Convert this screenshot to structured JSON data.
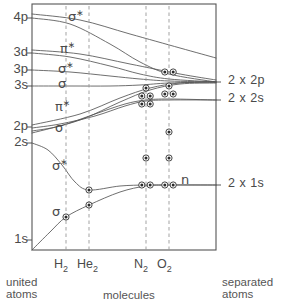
{
  "figure": {
    "type": "correlation-diagram",
    "title_visible": false,
    "frame": {
      "left": 32,
      "right": 216,
      "top": 4,
      "bottom": 250
    },
    "stroke_color": "#555555",
    "dash_color": "#999999",
    "text_color": "#4a4a4a"
  },
  "axis_left": {
    "name": "united-atom-orbital-levels",
    "ticks": [
      {
        "label": "4p",
        "y": 18
      },
      {
        "label": "3d",
        "y": 53
      },
      {
        "label": "3p",
        "y": 70
      },
      {
        "label": "3s",
        "y": 86
      },
      {
        "label": "2p",
        "y": 127
      },
      {
        "label": "2s",
        "y": 143
      },
      {
        "label": "1s",
        "y": 240
      }
    ]
  },
  "axis_right": {
    "name": "separated-atom-orbital-levels",
    "ticks": [
      {
        "label": "2 x 2p",
        "y": 82
      },
      {
        "label": "2 x 2s",
        "y": 100
      },
      {
        "label": "2 x 1s",
        "y": 185
      }
    ]
  },
  "orbital_labels": [
    {
      "text": "σ",
      "star": true,
      "x": 68,
      "y": 9,
      "name": "sigma-star-4p"
    },
    {
      "text": "π",
      "star": true,
      "x": 60,
      "y": 41,
      "name": "pi-star-3d"
    },
    {
      "text": "σ",
      "star": true,
      "x": 58,
      "y": 61,
      "name": "sigma-star-3p"
    },
    {
      "text": "σ",
      "star": false,
      "x": 58,
      "y": 77,
      "name": "sigma-3s"
    },
    {
      "text": "π",
      "star": true,
      "x": 55,
      "y": 99,
      "name": "pi-star-2p"
    },
    {
      "text": "σ",
      "star": false,
      "x": 55,
      "y": 121,
      "name": "sigma-2p"
    },
    {
      "text": "σ",
      "star": true,
      "x": 52,
      "y": 158,
      "name": "sigma-star-2s"
    },
    {
      "text": "σ",
      "star": false,
      "x": 52,
      "y": 205,
      "name": "sigma-1s"
    },
    {
      "text": "n",
      "star": false,
      "x": 181,
      "y": 173,
      "name": "nonbonding-n"
    }
  ],
  "molecules": [
    {
      "label": "H",
      "sub": "2",
      "x": 66,
      "name": "molecule-h2"
    },
    {
      "label": "He",
      "sub": "2",
      "x": 89,
      "name": "molecule-he2"
    },
    {
      "label": "N",
      "sub": "2",
      "x": 146,
      "name": "molecule-n2"
    },
    {
      "label": "O",
      "sub": "2",
      "x": 169,
      "name": "molecule-o2"
    }
  ],
  "footer": {
    "united_line1": "united",
    "united_line2": "atoms",
    "middle": "molecules",
    "separated_line1": "separated",
    "separated_line2": "atoms"
  },
  "chart_data": {
    "type": "line",
    "xlabel": "molecules",
    "ylabel": "orbital energy",
    "grid": false,
    "legend_position": "none",
    "x_category_positions": {
      "united_atom": 32,
      "H2": 66,
      "He2": 89,
      "N2": 146,
      "O2": 169,
      "separated_atoms": 216
    },
    "united_atom_levels": [
      "1s",
      "2s",
      "2p",
      "3s",
      "3p",
      "3d",
      "4p"
    ],
    "separated_atom_levels": [
      "2 x 1s",
      "2 x 2s",
      "2 x 2p"
    ],
    "correlation_curves": [
      {
        "name": "sigma-1s-bonding",
        "label": "σ",
        "from": "1s",
        "to": "2 x 1s",
        "path": [
          [
            32,
            250
          ],
          [
            50,
            232
          ],
          [
            66,
            217
          ],
          [
            89,
            205
          ],
          [
            120,
            192
          ],
          [
            146,
            186
          ],
          [
            169,
            185
          ],
          [
            216,
            185
          ]
        ]
      },
      {
        "name": "sigma-star-2s",
        "label": "σ*",
        "from": "2s",
        "to": "2 x 1s",
        "path": [
          [
            32,
            143
          ],
          [
            48,
            150
          ],
          [
            62,
            165
          ],
          [
            75,
            182
          ],
          [
            89,
            190
          ],
          [
            120,
            186
          ],
          [
            146,
            185
          ],
          [
            169,
            185
          ],
          [
            216,
            185
          ]
        ]
      },
      {
        "name": "sigma-2p",
        "label": "σ",
        "from": "2p",
        "to": "2 x 2s",
        "path": [
          [
            32,
            128
          ],
          [
            60,
            124
          ],
          [
            95,
            116
          ],
          [
            125,
            106
          ],
          [
            146,
            101
          ],
          [
            169,
            100
          ],
          [
            216,
            100
          ]
        ]
      },
      {
        "name": "pi-star-2p",
        "label": "π*",
        "from": "2p",
        "to": "2 x 2s",
        "path": [
          [
            32,
            131
          ],
          [
            60,
            126
          ],
          [
            95,
            114
          ],
          [
            125,
            104
          ],
          [
            146,
            100
          ],
          [
            169,
            99
          ],
          [
            216,
            100
          ]
        ]
      },
      {
        "name": "sigma-3s",
        "label": "σ",
        "from": "3s",
        "to": "2 x 2p",
        "path": [
          [
            32,
            86
          ],
          [
            70,
            86
          ],
          [
            110,
            86
          ],
          [
            140,
            85
          ],
          [
            169,
            83
          ],
          [
            216,
            82
          ]
        ]
      },
      {
        "name": "sigma-star-3p",
        "label": "σ*",
        "from": "3p",
        "to": "2 x 2p",
        "path": [
          [
            32,
            70
          ],
          [
            70,
            72
          ],
          [
            110,
            76
          ],
          [
            140,
            79
          ],
          [
            169,
            81
          ],
          [
            216,
            82
          ]
        ]
      },
      {
        "name": "pi-star-3d",
        "label": "π*",
        "from": "3d",
        "to": "2 x 2p",
        "path": [
          [
            32,
            53
          ],
          [
            70,
            57
          ],
          [
            110,
            66
          ],
          [
            140,
            74
          ],
          [
            169,
            79
          ],
          [
            216,
            82
          ]
        ]
      },
      {
        "name": "sigma-star-4p",
        "label": "σ*",
        "from": "4p",
        "to": "2 x 2p",
        "path": [
          [
            32,
            18
          ],
          [
            70,
            24
          ],
          [
            110,
            44
          ],
          [
            140,
            62
          ],
          [
            169,
            74
          ],
          [
            216,
            82
          ]
        ]
      },
      {
        "name": "upper-branch-a",
        "label": "",
        "from": "4p",
        "to": "upper-right",
        "path": [
          [
            32,
            14
          ],
          [
            80,
            20
          ],
          [
            130,
            34
          ],
          [
            180,
            48
          ],
          [
            216,
            58
          ]
        ]
      },
      {
        "name": "upper-branch-b",
        "label": "",
        "from": "3d",
        "to": "upper-right",
        "path": [
          [
            32,
            50
          ],
          [
            80,
            54
          ],
          [
            130,
            64
          ],
          [
            180,
            74
          ],
          [
            216,
            80
          ]
        ]
      },
      {
        "name": "lower-fan-a",
        "label": "",
        "from": "2p-region",
        "to": "2 x 2p",
        "path": [
          [
            32,
            125
          ],
          [
            80,
            114
          ],
          [
            120,
            98
          ],
          [
            150,
            88
          ],
          [
            180,
            83
          ],
          [
            216,
            82
          ]
        ]
      },
      {
        "name": "lower-fan-b",
        "label": "",
        "from": "2p-region",
        "to": "2 x 2p",
        "path": [
          [
            32,
            133
          ],
          [
            80,
            120
          ],
          [
            120,
            102
          ],
          [
            150,
            90
          ],
          [
            180,
            84
          ],
          [
            216,
            83
          ]
        ]
      }
    ],
    "electron_dots": [
      {
        "molecule": "H2",
        "x": 66,
        "y": 217,
        "count": 1,
        "orbital": "σ 1s"
      },
      {
        "molecule": "He2",
        "x": 89,
        "y": 205,
        "count": 1,
        "orbital": "σ 1s"
      },
      {
        "molecule": "He2",
        "x": 89,
        "y": 190,
        "count": 1,
        "orbital": "σ* 2s"
      },
      {
        "molecule": "N2",
        "x": 146,
        "y": 185,
        "count": 2,
        "orbital": "n"
      },
      {
        "molecule": "N2",
        "x": 146,
        "y": 158,
        "count": 1,
        "orbital": "σ 2p"
      },
      {
        "molecule": "N2",
        "x": 146,
        "y": 104,
        "count": 2,
        "orbital": "σ 2p / π"
      },
      {
        "molecule": "N2",
        "x": 146,
        "y": 96,
        "count": 2,
        "orbital": "π"
      },
      {
        "molecule": "N2",
        "x": 146,
        "y": 88,
        "count": 1,
        "orbital": "σ 3s"
      },
      {
        "molecule": "O2",
        "x": 169,
        "y": 185,
        "count": 2,
        "orbital": "n"
      },
      {
        "molecule": "O2",
        "x": 169,
        "y": 158,
        "count": 1,
        "orbital": "σ 2p"
      },
      {
        "molecule": "O2",
        "x": 169,
        "y": 132,
        "count": 1,
        "orbital": "π"
      },
      {
        "molecule": "O2",
        "x": 169,
        "y": 94,
        "count": 2,
        "orbital": "π*"
      },
      {
        "molecule": "O2",
        "x": 169,
        "y": 86,
        "count": 1,
        "orbital": "σ"
      },
      {
        "molecule": "O2",
        "x": 169,
        "y": 72,
        "count": 2,
        "orbital": "σ*"
      }
    ]
  }
}
